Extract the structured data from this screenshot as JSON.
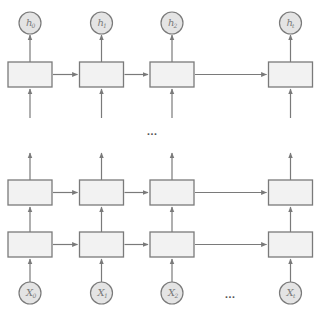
{
  "diagram": {
    "colors": {
      "stroke": "#7a7a7a",
      "box_fill": "#f2f2f2",
      "circle_fill": "#e4e4e4"
    },
    "columns_x": [
      30,
      101.5,
      172,
      290.5
    ],
    "box": {
      "width": 44,
      "height": 25
    },
    "layers": [
      {
        "name": "top-layer",
        "y": 62
      },
      {
        "name": "middle-layer",
        "y": 180
      },
      {
        "name": "bottom-layer",
        "y": 232
      }
    ],
    "outputs": [
      {
        "label": "h",
        "sub": "0"
      },
      {
        "label": "h",
        "sub": "1"
      },
      {
        "label": "h",
        "sub": "2"
      },
      {
        "label": "h",
        "sub": "t"
      }
    ],
    "inputs": [
      {
        "label": "X",
        "sub": "0"
      },
      {
        "label": "X",
        "sub": "1"
      },
      {
        "label": "X",
        "sub": "2"
      },
      {
        "label": "X",
        "sub": "t"
      }
    ],
    "output_circle_cy": 23,
    "input_circle_cy": 293,
    "circle_r": 11,
    "ellipses": [
      {
        "name": "layer-gap-ellipsis",
        "text": "...",
        "x": 152,
        "y": 135
      },
      {
        "name": "time-gap-ellipsis",
        "text": "...",
        "x": 230,
        "y": 298
      }
    ]
  }
}
